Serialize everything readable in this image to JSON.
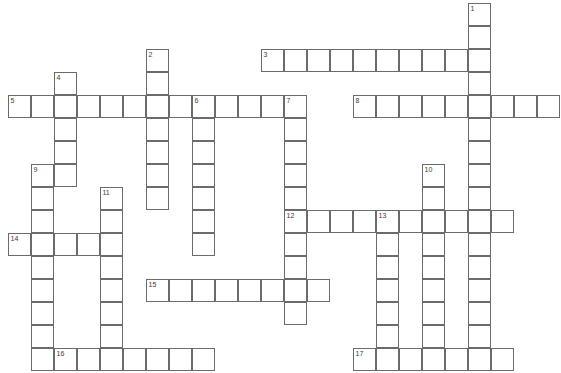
{
  "puzzle": {
    "title": "Crossword Puzzle Grid",
    "grid": {
      "cell_size": 23,
      "origin_x": 8,
      "origin_y": 3,
      "columns": 24,
      "rows": 16,
      "line_color": "#6b6b6b",
      "background_color": "#ffffff",
      "number_color": "#3a3a3a"
    },
    "entries": [
      {
        "number": "1",
        "direction": "down",
        "start_col": 20,
        "start_row": 0,
        "length": 15,
        "answer": ""
      },
      {
        "number": "2",
        "direction": "down",
        "start_col": 6,
        "start_row": 2,
        "length": 7,
        "answer": ""
      },
      {
        "number": "3",
        "direction": "across",
        "start_col": 11,
        "start_row": 2,
        "length": 10,
        "answer": ""
      },
      {
        "number": "4",
        "direction": "down",
        "start_col": 2,
        "start_row": 3,
        "length": 5,
        "answer": ""
      },
      {
        "number": "5",
        "direction": "across",
        "start_col": 0,
        "start_row": 4,
        "length": 13,
        "answer": ""
      },
      {
        "number": "6",
        "direction": "down",
        "start_col": 8,
        "start_row": 4,
        "length": 7,
        "answer": ""
      },
      {
        "number": "7",
        "direction": "down",
        "start_col": 12,
        "start_row": 4,
        "length": 10,
        "answer": ""
      },
      {
        "number": "8",
        "direction": "across",
        "start_col": 15,
        "start_row": 4,
        "length": 9,
        "answer": ""
      },
      {
        "number": "9",
        "direction": "down",
        "start_col": 1,
        "start_row": 7,
        "length": 9,
        "answer": ""
      },
      {
        "number": "10",
        "direction": "down",
        "start_col": 18,
        "start_row": 7,
        "length": 8,
        "answer": ""
      },
      {
        "number": "11",
        "direction": "down",
        "start_col": 4,
        "start_row": 8,
        "length": 8,
        "answer": ""
      },
      {
        "number": "12",
        "direction": "across",
        "start_col": 12,
        "start_row": 9,
        "length": 10,
        "answer": ""
      },
      {
        "number": "13",
        "direction": "down",
        "start_col": 16,
        "start_row": 9,
        "length": 7,
        "answer": ""
      },
      {
        "number": "14",
        "direction": "across",
        "start_col": 0,
        "start_row": 10,
        "length": 5,
        "answer": ""
      },
      {
        "number": "15",
        "direction": "across",
        "start_col": 6,
        "start_row": 12,
        "length": 8,
        "answer": ""
      },
      {
        "number": "16",
        "direction": "across",
        "start_col": 2,
        "start_row": 15,
        "length": 7,
        "answer": ""
      },
      {
        "number": "17",
        "direction": "across",
        "start_col": 15,
        "start_row": 15,
        "length": 7,
        "answer": ""
      }
    ]
  }
}
